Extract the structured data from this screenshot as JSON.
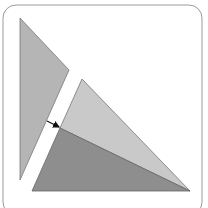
{
  "diagram": {
    "frame": {
      "x": 3,
      "y": 5,
      "width": 199,
      "height": 210,
      "radius": 13,
      "stroke": "#9a9a9a"
    },
    "shapes": [
      {
        "name": "left-triangle",
        "points": "20,18 69,70 20,180",
        "fill": "#b5b5b5",
        "stroke": "#777777"
      },
      {
        "name": "light-triangle",
        "points": "82,79 190,191 60,128",
        "fill": "#c9c9c9",
        "stroke": "#777777"
      },
      {
        "name": "dark-triangle",
        "points": "60,128 190,191 32,191",
        "fill": "#8e8e8e",
        "stroke": "#666666"
      }
    ],
    "arrow": {
      "x1": 47,
      "y1": 121,
      "x2": 59,
      "y2": 127,
      "color": "#111111"
    }
  }
}
